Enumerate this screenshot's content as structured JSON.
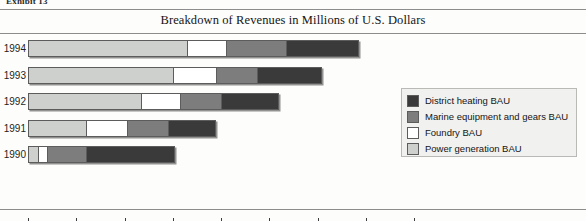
{
  "exhibit": {
    "caption": "Exhibit 13"
  },
  "chart_title": "Breakdown of Revenues in Millions of U.S. Dollars",
  "legend": {
    "items": [
      {
        "label": "District heating BAU",
        "color": "#3a3a3a"
      },
      {
        "label": "Marine equipment and gears BAU",
        "color": "#7d7d7d"
      },
      {
        "label": "Foundry BAU",
        "color": "#ffffff"
      },
      {
        "label": "Power generation BAU",
        "color": "#cdd0cd"
      }
    ]
  },
  "chart_data": {
    "type": "bar",
    "orientation": "horizontal",
    "stacked": true,
    "title": "Breakdown of Revenues in Millions of U.S. Dollars",
    "xlabel": "",
    "ylabel": "",
    "xlim": [
      0,
      160
    ],
    "xticks": [
      0,
      20,
      40,
      60,
      80,
      100,
      120,
      140,
      160
    ],
    "xticklabels": [
      "0",
      "20",
      "40",
      "60",
      "80",
      "100",
      "120",
      "140",
      "160"
    ],
    "grid": false,
    "legend_position": "right-inside",
    "categories": [
      "1994",
      "1993",
      "1992",
      "1991",
      "1990"
    ],
    "series": [
      {
        "name": "Power generation BAU",
        "color": "#cdd0cd",
        "values": [
          66,
          60,
          47,
          24,
          4
        ]
      },
      {
        "name": "Foundry BAU",
        "color": "#ffffff",
        "values": [
          16,
          18,
          16,
          17,
          4
        ]
      },
      {
        "name": "Marine equipment and gears BAU",
        "color": "#7d7d7d",
        "values": [
          25,
          17,
          17,
          17,
          16
        ]
      },
      {
        "name": "District heating BAU",
        "color": "#3a3a3a",
        "values": [
          30,
          27,
          24,
          20,
          37
        ]
      }
    ],
    "totals": [
      137,
      122,
      104,
      78,
      61
    ]
  }
}
